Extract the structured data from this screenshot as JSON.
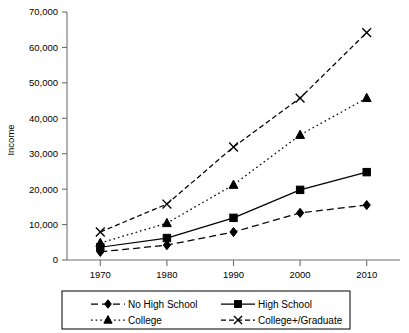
{
  "chart_data": {
    "type": "line",
    "title": "",
    "xlabel": "",
    "ylabel": "Income",
    "x": [
      1970,
      1980,
      1990,
      2000,
      2010
    ],
    "categories": [
      "1970",
      "1980",
      "1990",
      "2000",
      "2010"
    ],
    "xlim": [
      1965,
      2015
    ],
    "ylim": [
      0,
      70000
    ],
    "ytick_labels": [
      "0",
      "10,000",
      "20,000",
      "30,000",
      "40,000",
      "50,000",
      "60,000",
      "70,000"
    ],
    "ytick_values": [
      0,
      10000,
      20000,
      30000,
      40000,
      50000,
      60000,
      70000
    ],
    "xtick_labels": [
      "1970",
      "1980",
      "1990",
      "2000",
      "2010"
    ],
    "grid": false,
    "legend_position": "bottom",
    "series": [
      {
        "name": "No High School",
        "marker": "diamond",
        "dash": "dashed",
        "values": [
          2300,
          4200,
          7900,
          13300,
          15500
        ]
      },
      {
        "name": "High School",
        "marker": "square",
        "dash": "solid",
        "values": [
          3600,
          6200,
          11900,
          19800,
          24800
        ]
      },
      {
        "name": "College",
        "marker": "triangle",
        "dash": "dotted",
        "values": [
          4800,
          10400,
          21200,
          35300,
          45700
        ]
      },
      {
        "name": "College+/Graduate",
        "marker": "cross",
        "dash": "dashdot",
        "values": [
          7900,
          15800,
          31900,
          45700,
          64200
        ]
      }
    ]
  },
  "legend": {
    "entries": [
      {
        "label": "No High School"
      },
      {
        "label": "High School"
      },
      {
        "label": "College"
      },
      {
        "label": "College+/Graduate"
      }
    ]
  }
}
